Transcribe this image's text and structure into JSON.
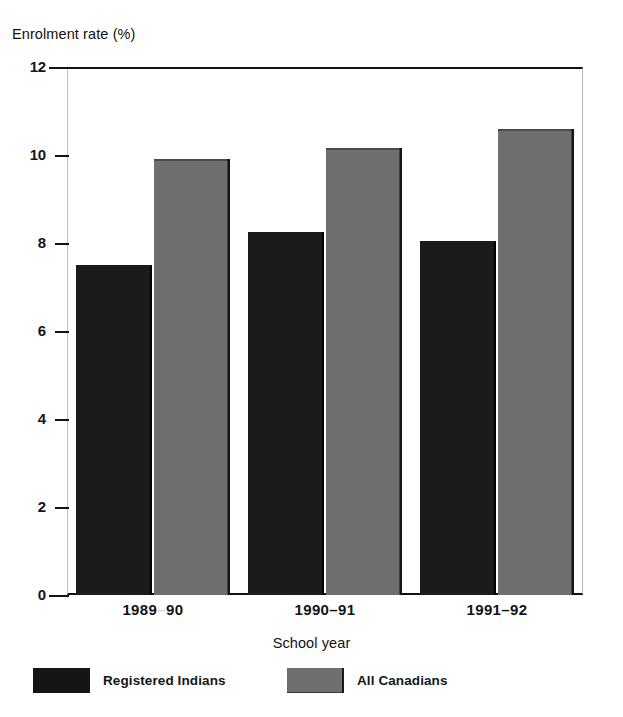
{
  "figure": {
    "top_fragment_text": "· ·",
    "background_color": "#ffffff"
  },
  "axes": {
    "y_title": "Enrolment rate (%)",
    "x_title": "School year"
  },
  "legend": {
    "items": [
      {
        "label": "Registered Indians",
        "color": "#1b1b1b",
        "swatch": "dark"
      },
      {
        "label": "All Canadians",
        "color": "#6f6f6f",
        "swatch": "gray"
      }
    ]
  },
  "chart_data": {
    "type": "bar",
    "title": "",
    "subtitle": "",
    "xlabel": "School year",
    "ylabel": "Enrolment rate (%)",
    "categories": [
      "1989–90",
      "1990–91",
      "1991–92"
    ],
    "series": [
      {
        "name": "Registered Indians",
        "color": "#1b1b1b",
        "values": [
          7.5,
          8.25,
          8.05
        ]
      },
      {
        "name": "All Canadians",
        "color": "#6f6f6f",
        "values": [
          9.9,
          10.15,
          10.6
        ]
      }
    ],
    "ylim": [
      0,
      12
    ],
    "yticks": [
      0,
      2,
      4,
      6,
      8,
      10,
      12
    ],
    "ytick_labels": [
      "0",
      "2",
      "4",
      "6",
      "8",
      "10",
      "12"
    ],
    "grid": false,
    "legend_position": "below-axis"
  }
}
